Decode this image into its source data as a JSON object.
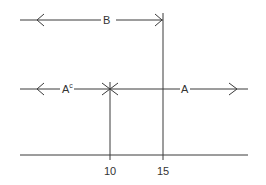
{
  "diagram": {
    "labels": {
      "B": "B",
      "A_complement": "A",
      "A_complement_sup": "c",
      "A": "A"
    },
    "ticks": [
      "10",
      "15"
    ],
    "colors": {
      "line": "#3a3a3a",
      "background": "#ffffff"
    }
  }
}
